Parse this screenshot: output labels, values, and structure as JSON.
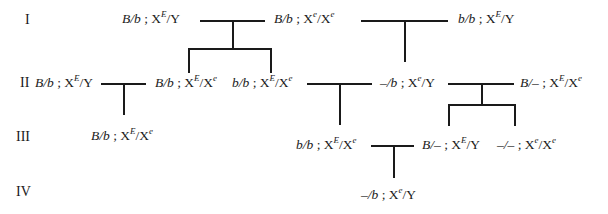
{
  "diagram": {
    "type": "pedigree",
    "generations": [
      "I",
      "II",
      "III",
      "IV"
    ],
    "individuals": {
      "I_1": {
        "auto": "B/b",
        "sex_chr": "X",
        "sup1": "E",
        "rest": "/Y"
      },
      "I_2": {
        "auto": "B/b",
        "sex_chr": "X",
        "sup1": "e",
        "rest2": "/X",
        "sup2": "e"
      },
      "I_3": {
        "auto": "b/b",
        "sex_chr": "X",
        "sup1": "E",
        "rest": "/Y"
      },
      "II_1": {
        "auto": "B/b",
        "sex_chr": "X",
        "sup1": "E",
        "rest": "/Y"
      },
      "II_2": {
        "auto": "B/b",
        "sex_chr": "X",
        "sup1": "E",
        "rest2": "/X",
        "sup2": "e"
      },
      "II_3": {
        "auto": "b/b",
        "sex_chr": "X",
        "sup1": "E",
        "rest2": "/X",
        "sup2": "e"
      },
      "II_4": {
        "auto": "–/b",
        "sex_chr": "X",
        "sup1": "e",
        "rest": "/Y"
      },
      "II_5": {
        "auto": "B/–",
        "sex_chr": "X",
        "sup1": "E",
        "rest2": "/X",
        "sup2": "e"
      },
      "III_1": {
        "auto": "B/b",
        "sex_chr": "X",
        "sup1": "E",
        "rest2": "/X",
        "sup2": "e"
      },
      "III_2": {
        "auto": "b/b",
        "sex_chr": "X",
        "sup1": "E",
        "rest2": "/X",
        "sup2": "e"
      },
      "III_3": {
        "auto": "B/–",
        "sex_chr": "X",
        "sup1": "E",
        "rest": "/Y"
      },
      "III_4": {
        "auto": "–/–",
        "sex_chr": "X",
        "sup1": "e",
        "rest2": "/X",
        "sup2": "e"
      },
      "IV_1": {
        "auto": "–/b",
        "sex_chr": "X",
        "sup1": "e",
        "rest": "/Y"
      }
    },
    "separator": " ; "
  }
}
